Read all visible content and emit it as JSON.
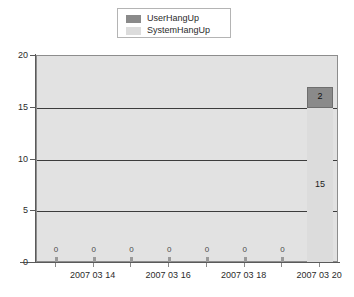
{
  "chart_data": {
    "type": "bar",
    "subtype": "stacked-bar",
    "title": "",
    "xlabel": "",
    "ylabel": "",
    "ylim": [
      0,
      20
    ],
    "yticks": [
      0,
      5,
      10,
      15,
      20
    ],
    "ytick_labels": [
      "0",
      "5",
      "10",
      "15",
      "20"
    ],
    "grid": true,
    "gridline_values": [
      5,
      10,
      15
    ],
    "legend_position": "top-center",
    "categories": [
      "2007 03 13",
      "2007 03 14",
      "2007 03 15",
      "2007 03 16",
      "2007 03 17",
      "2007 03 18",
      "2007 03 19",
      "2007 03 20"
    ],
    "xtick_labels": [
      "",
      "2007 03 14",
      "",
      "2007 03 16",
      "",
      "2007 03 18",
      "",
      "2007 03 20"
    ],
    "series": [
      {
        "name": "SystemHangUp",
        "color": "#dcdcdc",
        "values": [
          0,
          0,
          0,
          0,
          0,
          0,
          0,
          15
        ]
      },
      {
        "name": "UserHangUp",
        "color": "#8a8a8a",
        "values": [
          0,
          0,
          0,
          0,
          0,
          0,
          0,
          2
        ]
      }
    ],
    "data_labels": [
      {
        "category_index": 0,
        "text": "0"
      },
      {
        "category_index": 1,
        "text": "0"
      },
      {
        "category_index": 2,
        "text": "0"
      },
      {
        "category_index": 3,
        "text": "0"
      },
      {
        "category_index": 4,
        "text": "0"
      },
      {
        "category_index": 5,
        "text": "0"
      },
      {
        "category_index": 6,
        "text": "0"
      },
      {
        "category_index": 7,
        "series": "SystemHangUp",
        "text": "15"
      },
      {
        "category_index": 7,
        "series": "UserHangUp",
        "text": "2"
      }
    ]
  },
  "legend": {
    "items": [
      {
        "label": "UserHangUp",
        "color": "#8a8a8a"
      },
      {
        "label": "SystemHangUp",
        "color": "#dcdcdc"
      }
    ]
  },
  "axis": {
    "y_labels": [
      "20",
      "15",
      "10",
      "5",
      "0"
    ],
    "x_labels": [
      "2007 03 14",
      "2007 03 16",
      "2007 03 18",
      "2007 03 20"
    ]
  },
  "bar_labels": {
    "zero": "0",
    "system_value": "15",
    "user_value": "2"
  },
  "colors": {
    "plot_background": "#e2e2e2",
    "gridline": "#3c3c3c",
    "axis": "#5a5a5a",
    "user_hangup": "#8a8a8a",
    "system_hangup": "#dcdcdc"
  }
}
